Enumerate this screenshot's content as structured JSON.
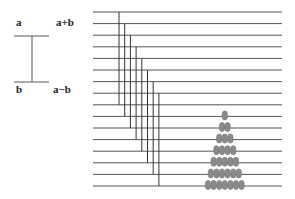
{
  "legend": {
    "top_left": "a",
    "top_right": "a+b",
    "bottom_left": "b",
    "bottom_right": "a−b"
  },
  "diagram": {
    "horizontal_lines": 16,
    "line_top_y": 12,
    "line_spacing": 11.6,
    "line_x_start": 93,
    "line_x_end": 282,
    "vertical_bars": 8,
    "vertical_first_x": 119,
    "vertical_spacing": 5.7,
    "vertical_span_lines": 8,
    "line_color": "#555555",
    "ball_color": "#8a8a8a",
    "ball_stack_counts": [
      1,
      2,
      3,
      4,
      5,
      6,
      7
    ],
    "ball_stack_center_x": 225
  }
}
